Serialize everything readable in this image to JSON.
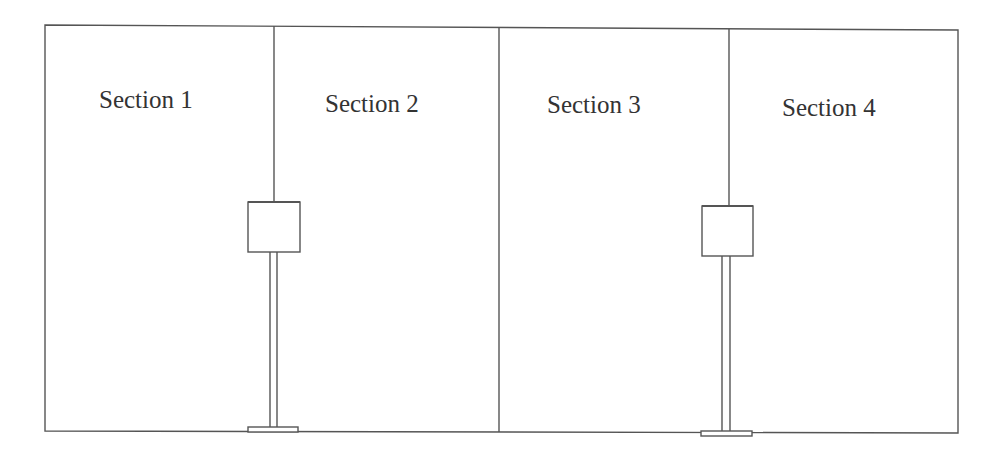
{
  "diagram": {
    "type": "floor-plan-sections",
    "stroke_color": "#555555",
    "background": "#ffffff",
    "sections": [
      {
        "label": "Section 1"
      },
      {
        "label": "Section 2"
      },
      {
        "label": "Section 3"
      },
      {
        "label": "Section 4"
      }
    ],
    "fixtures": [
      {
        "name": "box-on-post",
        "between": [
          "Section 1",
          "Section 2"
        ]
      },
      {
        "name": "box-on-post",
        "between": [
          "Section 3",
          "Section 4"
        ]
      }
    ]
  }
}
